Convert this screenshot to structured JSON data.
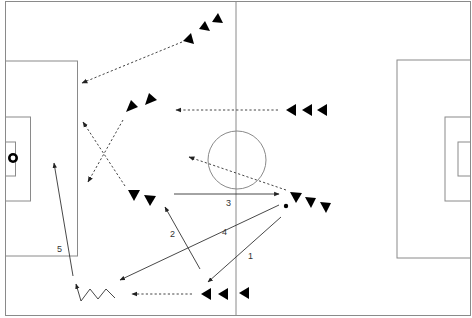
{
  "diagram": {
    "colors": {
      "background": "#ffffff",
      "field_lines": "#8a8a8a",
      "players": "#000000",
      "pass_lines": "#333333"
    },
    "pass_labels": [
      {
        "id": "1",
        "text": "1"
      },
      {
        "id": "2",
        "text": "2"
      },
      {
        "id": "3",
        "text": "3"
      },
      {
        "id": "4",
        "text": "4"
      },
      {
        "id": "5",
        "text": "5"
      }
    ],
    "icons": {
      "ball": "soccer-ball-icon",
      "goal_ball": "soccer-ball-icon",
      "player": "triangle-player-icon"
    },
    "player_groups": [
      {
        "name": "top-attackers",
        "count": 3,
        "direction": "up"
      },
      {
        "name": "upper-mid-pair",
        "count": 2,
        "direction": "up-left"
      },
      {
        "name": "right-mid-trio",
        "count": 3,
        "direction": "left"
      },
      {
        "name": "lower-mid-pair",
        "count": 2,
        "direction": "down"
      },
      {
        "name": "ball-carrier-trio",
        "count": 3,
        "direction": "down"
      },
      {
        "name": "bottom-trio",
        "count": 3,
        "direction": "left"
      }
    ]
  }
}
